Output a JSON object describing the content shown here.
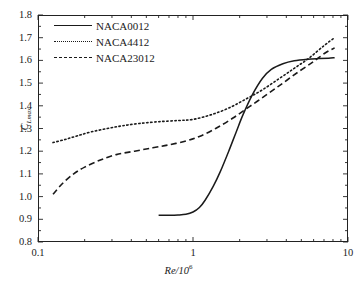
{
  "chart_data": {
    "type": "line",
    "title": "",
    "xlabel": "Re/10⁶",
    "ylabel": "C_Lmax",
    "ylabel_base": "C",
    "ylabel_sub": "Lmax",
    "xscale": "log",
    "yscale": "linear",
    "xlim": [
      0.1,
      10
    ],
    "ylim": [
      0.8,
      1.8
    ],
    "grid": false,
    "legend_position": "top-left inside",
    "xticks": [
      0.1,
      1,
      10
    ],
    "xtick_labels": [
      "0.1",
      "1",
      "10"
    ],
    "yticks": [
      0.8,
      0.9,
      1.0,
      1.1,
      1.2,
      1.3,
      1.4,
      1.5,
      1.6,
      1.7,
      1.8
    ],
    "ytick_labels": [
      "0.8",
      "0.9",
      "1.0",
      "1.1",
      "1.2",
      "1.3",
      "1.4",
      "1.5",
      "1.6",
      "1.7",
      "1.8"
    ],
    "yminor_step": 0.05,
    "series": [
      {
        "name": "NACA0012",
        "style": "solid",
        "color": "#1a1a1a",
        "x": [
          0.6,
          0.7,
          0.8,
          0.9,
          1.0,
          1.1,
          1.2,
          1.35,
          1.5,
          1.7,
          1.9,
          2.1,
          2.4,
          2.8,
          3.2,
          3.8,
          4.5,
          5.5,
          6.5,
          7.5,
          8.2
        ],
        "y": [
          0.918,
          0.918,
          0.919,
          0.922,
          0.932,
          0.952,
          0.985,
          1.045,
          1.11,
          1.2,
          1.285,
          1.36,
          1.445,
          1.52,
          1.56,
          1.585,
          1.598,
          1.605,
          1.608,
          1.61,
          1.612
        ]
      },
      {
        "name": "NACA4412",
        "style": "dotted",
        "color": "#1a1a1a",
        "x": [
          0.125,
          0.15,
          0.18,
          0.22,
          0.28,
          0.35,
          0.45,
          0.6,
          0.8,
          1.0,
          1.3,
          1.7,
          2.2,
          2.8,
          3.6,
          4.5,
          5.6,
          7.0,
          8.2
        ],
        "y": [
          1.238,
          1.252,
          1.268,
          1.285,
          1.3,
          1.312,
          1.322,
          1.33,
          1.335,
          1.34,
          1.36,
          1.39,
          1.43,
          1.47,
          1.52,
          1.565,
          1.61,
          1.665,
          1.7
        ]
      },
      {
        "name": "NACA23012",
        "style": "dashed",
        "color": "#1a1a1a",
        "x": [
          0.125,
          0.145,
          0.17,
          0.2,
          0.25,
          0.32,
          0.42,
          0.55,
          0.7,
          0.9,
          1.1,
          1.4,
          1.8,
          2.3,
          3.0,
          3.8,
          4.8,
          6.0,
          7.2,
          8.2
        ],
        "y": [
          1.01,
          1.06,
          1.1,
          1.13,
          1.16,
          1.185,
          1.2,
          1.215,
          1.228,
          1.245,
          1.265,
          1.3,
          1.345,
          1.395,
          1.45,
          1.5,
          1.55,
          1.595,
          1.635,
          1.655
        ]
      }
    ]
  },
  "legend": {
    "items": [
      {
        "label": "NACA0012",
        "style": "solid"
      },
      {
        "label": "NACA4412",
        "style": "dotted"
      },
      {
        "label": "NACA23012",
        "style": "dashed"
      }
    ]
  }
}
